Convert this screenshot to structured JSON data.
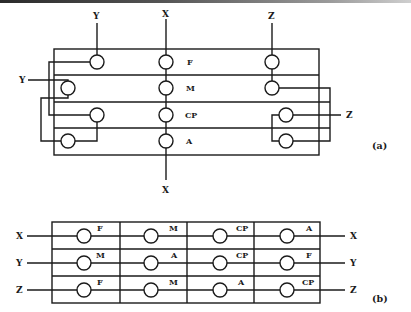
{
  "figure_a": {
    "caption": "(a)",
    "rows": [
      "F",
      "M",
      "CP",
      "A"
    ],
    "top_labels": {
      "y": "Y",
      "x": "X",
      "z": "Z"
    },
    "side_labels": {
      "y_left": "Y",
      "z_right": "Z"
    },
    "bottom_label": "X"
  },
  "figure_b": {
    "caption": "(b)",
    "rows": [
      {
        "left": "X",
        "right": "X",
        "cells": [
          "F",
          "M",
          "CP",
          "A"
        ]
      },
      {
        "left": "Y",
        "right": "Y",
        "cells": [
          "M",
          "A",
          "CP",
          "F"
        ]
      },
      {
        "left": "Z",
        "right": "Z",
        "cells": [
          "F",
          "M",
          "A",
          "CP"
        ]
      }
    ]
  }
}
